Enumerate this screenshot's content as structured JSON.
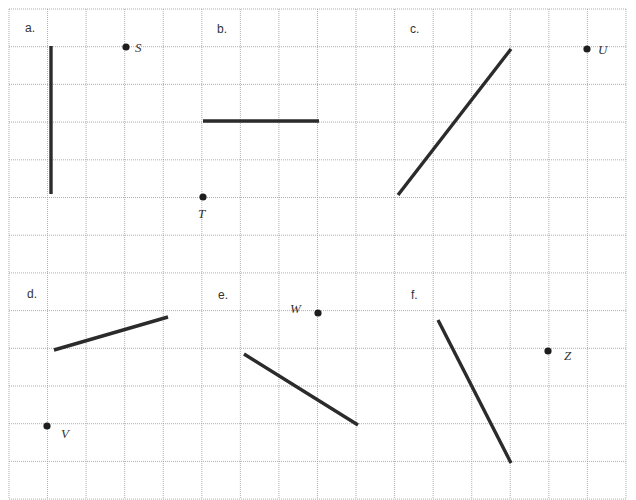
{
  "diagram": {
    "grid": {
      "x0": 9,
      "y0": 9,
      "cols": 16,
      "rows": 13,
      "col_width": 38.56,
      "row_height": 37.7,
      "line_color": "#9a9a9a"
    },
    "colors": {
      "segment": "#2b2b2b",
      "point": "#1e1e1e",
      "text": "#333333"
    },
    "panels": [
      {
        "id": "a",
        "label": "a.",
        "label_pos": [
          25,
          32
        ],
        "segment": {
          "x1": 51,
          "y1": 46,
          "x2": 51,
          "y2": 194
        },
        "point": {
          "name": "S",
          "x": 126,
          "y": 47,
          "label_pos": [
            135,
            52
          ]
        }
      },
      {
        "id": "b",
        "label": "b.",
        "label_pos": [
          217,
          33
        ],
        "segment": {
          "x1": 203,
          "y1": 121,
          "x2": 319,
          "y2": 121
        },
        "point": {
          "name": "T",
          "x": 203,
          "y": 197,
          "label_pos": [
            198,
            218
          ]
        }
      },
      {
        "id": "c",
        "label": "c.",
        "label_pos": [
          410,
          33
        ],
        "segment": {
          "x1": 511,
          "y1": 49,
          "x2": 398,
          "y2": 195
        },
        "point": {
          "name": "U",
          "x": 587,
          "y": 49,
          "label_pos": [
            598,
            54
          ]
        }
      },
      {
        "id": "d",
        "label": "d.",
        "label_pos": [
          27,
          298
        ],
        "segment": {
          "x1": 54,
          "y1": 350,
          "x2": 168,
          "y2": 317
        },
        "point": {
          "name": "V",
          "x": 47,
          "y": 426,
          "label_pos": [
            61,
            438
          ]
        }
      },
      {
        "id": "e",
        "label": "e.",
        "label_pos": [
          218,
          299
        ],
        "segment": {
          "x1": 244,
          "y1": 354,
          "x2": 358,
          "y2": 425
        },
        "point": {
          "name": "W",
          "x": 318,
          "y": 313,
          "label_pos": [
            290,
            313
          ]
        }
      },
      {
        "id": "f",
        "label": "f.",
        "label_pos": [
          411,
          299
        ],
        "segment": {
          "x1": 438,
          "y1": 320,
          "x2": 511,
          "y2": 463
        },
        "point": {
          "name": "Z",
          "x": 548,
          "y": 351,
          "label_pos": [
            564,
            360
          ]
        }
      }
    ]
  }
}
